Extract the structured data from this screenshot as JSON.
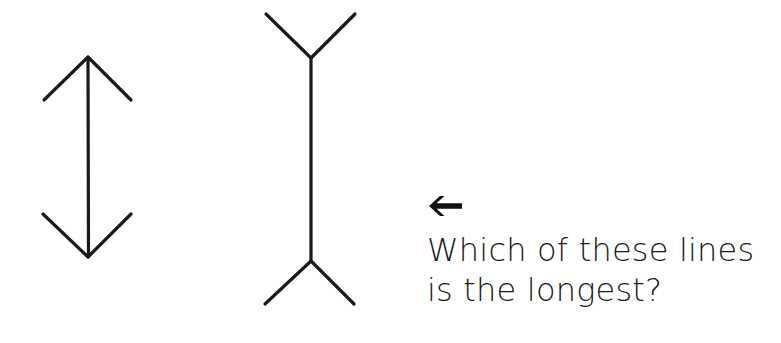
{
  "figure": {
    "type": "muller-lyer-illusion",
    "stroke_color": "#1a1a1a",
    "background_color": "#ffffff",
    "lines": [
      {
        "id": "left",
        "description": "vertical line with inward-pointing arrowheads",
        "shaft": {
          "x1": 88,
          "y1": 57,
          "x2": 88,
          "y2": 257
        },
        "top_fins": [
          {
            "x": 44,
            "y": 100
          },
          {
            "x": 131,
            "y": 100
          }
        ],
        "bottom_fins": [
          {
            "x": 43,
            "y": 214
          },
          {
            "x": 131,
            "y": 214
          }
        ]
      },
      {
        "id": "right",
        "description": "vertical line with outward-pointing fins",
        "shaft": {
          "x1": 311,
          "y1": 58,
          "x2": 311,
          "y2": 261
        },
        "top_fins": [
          {
            "x": 266,
            "y": 14
          },
          {
            "x": 355,
            "y": 14
          }
        ],
        "bottom_fins": [
          {
            "x": 265,
            "y": 304
          },
          {
            "x": 354,
            "y": 304
          }
        ]
      }
    ]
  },
  "caption": {
    "icon": "left-arrow-icon",
    "line1": "Which of these lines",
    "line2": "is the longest?"
  }
}
